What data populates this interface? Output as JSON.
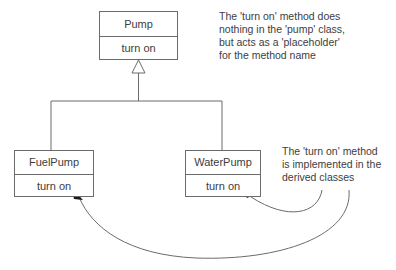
{
  "diagram": {
    "type": "uml-class-diagram",
    "title_visible": false,
    "colors": {
      "line": "#6b6b6b",
      "text": "#3d3d3d",
      "arrow": "#1a1a1a",
      "background": "#ffffff"
    },
    "classes": [
      {
        "id": "pump",
        "name": "Pump",
        "method": "turn on",
        "role": "base-class"
      },
      {
        "id": "fuelpump",
        "name": "FuelPump",
        "method": "turn on",
        "role": "derived-class"
      },
      {
        "id": "waterpump",
        "name": "WaterPump",
        "method": "turn on",
        "role": "derived-class"
      }
    ],
    "relationships": [
      {
        "from": "FuelPump",
        "to": "Pump",
        "kind": "generalization"
      },
      {
        "from": "WaterPump",
        "to": "Pump",
        "kind": "generalization"
      }
    ],
    "annotations": [
      {
        "id": "note-base",
        "text": "The 'turn on' method does\nnothing in the 'pump' class,\nbut acts as a 'placeholder'\nfor the method name",
        "points_to": []
      },
      {
        "id": "note-derived",
        "text": "The 'turn on' method\nis implemented in the\nderived classes",
        "points_to": [
          "FuelPump.turn on",
          "WaterPump.turn on"
        ]
      }
    ]
  }
}
